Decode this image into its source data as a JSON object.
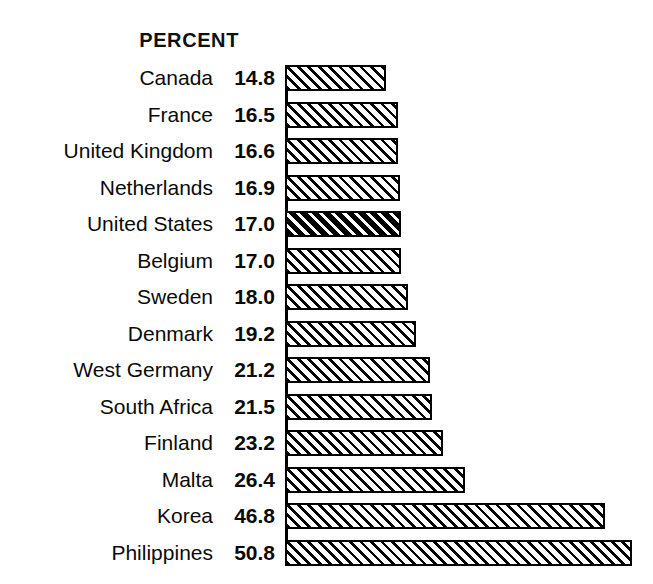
{
  "chart_header": {
    "label": "PERCENT"
  },
  "chart_data": {
    "type": "bar",
    "orientation": "horizontal",
    "title": "PERCENT",
    "subtitle": "",
    "xlabel": "",
    "ylabel": "",
    "xlim": [
      0,
      50.8
    ],
    "grid": false,
    "legend": false,
    "value_suffix": "",
    "categories": [
      "Canada",
      "France",
      "United Kingdom",
      "Netherlands",
      "United States",
      "Belgium",
      "Sweden",
      "Denmark",
      "West Germany",
      "South Africa",
      "Finland",
      "Malta",
      "Korea",
      "Philippines"
    ],
    "values": [
      14.8,
      16.5,
      16.6,
      16.9,
      17.0,
      17.0,
      18.0,
      19.2,
      21.2,
      21.5,
      23.2,
      26.4,
      46.8,
      50.8
    ],
    "value_labels": [
      "14.8",
      "16.5",
      "16.6",
      "16.9",
      "17.0",
      "17.0",
      "18.0",
      "19.2",
      "21.2",
      "21.5",
      "23.2",
      "26.4",
      "46.8",
      "50.8"
    ],
    "highlighted_category": "United States",
    "highlighted_index": 4,
    "colors": {
      "bar_outline": "#000000",
      "bar_fill": "#ffffff",
      "hatch": "#000000",
      "text": "#000000",
      "background": "#ffffff"
    }
  },
  "rows": [
    {
      "name": "Canada",
      "value": "14.8",
      "magnitude": 14.8,
      "highlight": false
    },
    {
      "name": "France",
      "value": "16.5",
      "magnitude": 16.5,
      "highlight": false
    },
    {
      "name": "United Kingdom",
      "value": "16.6",
      "magnitude": 16.6,
      "highlight": false
    },
    {
      "name": "Netherlands",
      "value": "16.9",
      "magnitude": 16.9,
      "highlight": false
    },
    {
      "name": "United States",
      "value": "17.0",
      "magnitude": 17.0,
      "highlight": true
    },
    {
      "name": "Belgium",
      "value": "17.0",
      "magnitude": 17.0,
      "highlight": false
    },
    {
      "name": "Sweden",
      "value": "18.0",
      "magnitude": 18.0,
      "highlight": false
    },
    {
      "name": "Denmark",
      "value": "19.2",
      "magnitude": 19.2,
      "highlight": false
    },
    {
      "name": "West Germany",
      "value": "21.2",
      "magnitude": 21.2,
      "highlight": false
    },
    {
      "name": "South Africa",
      "value": "21.5",
      "magnitude": 21.5,
      "highlight": false
    },
    {
      "name": "Finland",
      "value": "23.2",
      "magnitude": 23.2,
      "highlight": false
    },
    {
      "name": "Malta",
      "value": "26.4",
      "magnitude": 26.4,
      "highlight": false
    },
    {
      "name": "Korea",
      "value": "46.8",
      "magnitude": 46.8,
      "highlight": false
    },
    {
      "name": "Philippines",
      "value": "50.8",
      "magnitude": 50.8,
      "highlight": false
    }
  ],
  "layout": {
    "row_top_start": 60,
    "row_height": 36.5,
    "bar_origin_x": 285,
    "px_per_unit": 6.83
  }
}
